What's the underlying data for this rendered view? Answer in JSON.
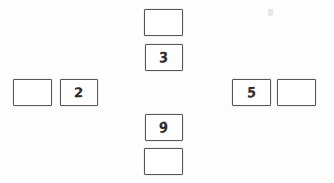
{
  "document": {
    "kind": "handwritten-worksheet",
    "layout": "cross",
    "page_background": "#fdfdfd",
    "box_border_color": "#55565a",
    "ink_color": "#2b2c30",
    "box_count": 8,
    "filled_count": 4,
    "empty_count": 4
  },
  "arms": {
    "top": {
      "label": "top-arm",
      "cells": [
        {
          "id": "top-outer",
          "value": "",
          "filled": false,
          "x": 144,
          "y": 9,
          "w": 39,
          "h": 27
        },
        {
          "id": "top-inner",
          "value": "3",
          "filled": true,
          "x": 145,
          "y": 44,
          "w": 38,
          "h": 27
        }
      ]
    },
    "left": {
      "label": "left-arm",
      "cells": [
        {
          "id": "left-outer",
          "value": "",
          "filled": false,
          "x": 13,
          "y": 79,
          "w": 39,
          "h": 27
        },
        {
          "id": "left-inner",
          "value": "2",
          "filled": true,
          "x": 60,
          "y": 79,
          "w": 38,
          "h": 27
        }
      ]
    },
    "right": {
      "label": "right-arm",
      "cells": [
        {
          "id": "right-inner",
          "value": "5",
          "filled": true,
          "x": 232,
          "y": 79,
          "w": 39,
          "h": 27
        },
        {
          "id": "right-outer",
          "value": "",
          "filled": false,
          "x": 277,
          "y": 79,
          "w": 39,
          "h": 27
        }
      ]
    },
    "bottom": {
      "label": "bottom-arm",
      "cells": [
        {
          "id": "bottom-inner",
          "value": "9",
          "filled": true,
          "x": 145,
          "y": 114,
          "w": 38,
          "h": 27
        },
        {
          "id": "bottom-outer",
          "value": "",
          "filled": false,
          "x": 144,
          "y": 148,
          "w": 39,
          "h": 27
        }
      ]
    }
  },
  "values": {
    "top": "3",
    "left": "2",
    "right": "5",
    "bottom": "9"
  }
}
